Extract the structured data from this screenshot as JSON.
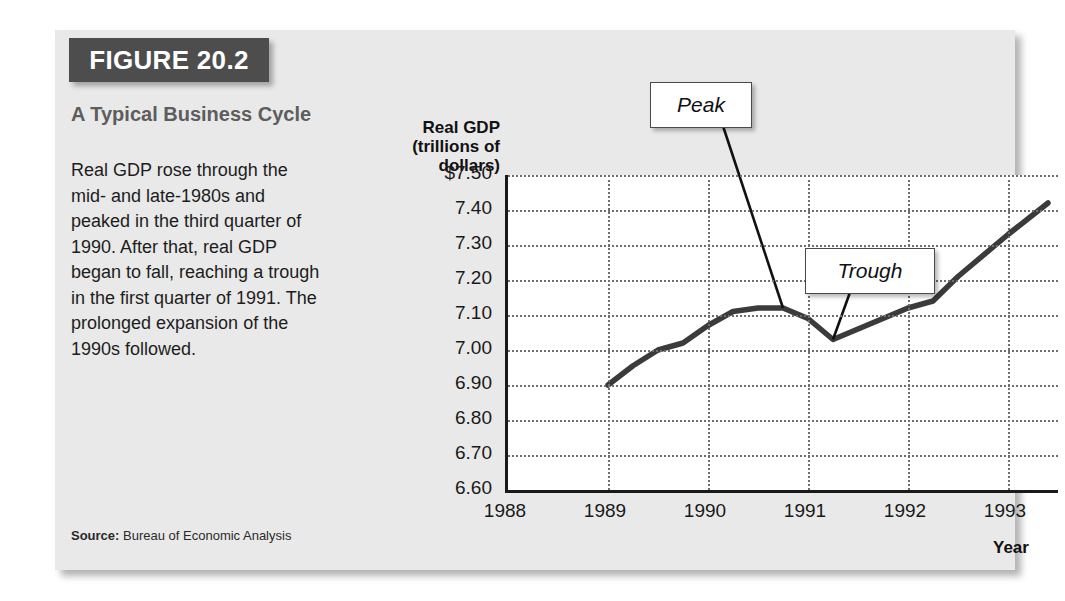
{
  "figure": {
    "header_label": "FIGURE 20.2",
    "subtitle": "A Typical Business Cycle",
    "body_text": "Real GDP rose through the mid- and late-1980s and peaked in the third quarter of 1990. After that, real GDP began to fall, reaching a trough in the first quarter of 1991. The prolonged expansion of the 1990s followed.",
    "source_label": "Source:",
    "source_value": "Bureau of Economic Analysis"
  },
  "chart_data": {
    "type": "line",
    "title": "A Typical Business Cycle",
    "ylabel": "Real GDP (trillions of dollars)",
    "xlabel": "Year",
    "ylim": [
      6.6,
      7.5
    ],
    "xlim": [
      1988,
      1993.5
    ],
    "grid": true,
    "legend": "none",
    "ytick_labels": [
      "$7.50",
      "7.40",
      "7.30",
      "7.20",
      "7.10",
      "7.00",
      "6.90",
      "6.80",
      "6.70",
      "6.60"
    ],
    "ytick_values": [
      7.5,
      7.4,
      7.3,
      7.2,
      7.1,
      7.0,
      6.9,
      6.8,
      6.7,
      6.6
    ],
    "xtick_labels": [
      "1988",
      "1989",
      "1990",
      "1991",
      "1992",
      "1993"
    ],
    "xtick_values": [
      1988,
      1989,
      1990,
      1991,
      1992,
      1993
    ],
    "series": [
      {
        "name": "Real GDP",
        "color": "#3b3b3b",
        "x": [
          1989.0,
          1989.25,
          1989.5,
          1989.75,
          1990.0,
          1990.25,
          1990.5,
          1990.75,
          1991.0,
          1991.25,
          1991.5,
          1991.75,
          1992.0,
          1992.25,
          1992.5,
          1993.0,
          1993.4
        ],
        "y": [
          6.9,
          6.955,
          7.0,
          7.02,
          7.07,
          7.11,
          7.12,
          7.12,
          7.09,
          7.03,
          7.06,
          7.09,
          7.12,
          7.14,
          7.21,
          7.33,
          7.42
        ]
      }
    ],
    "annotations": [
      {
        "label": "Peak",
        "x": 1990.75,
        "y": 7.12
      },
      {
        "label": "Trough",
        "x": 1991.25,
        "y": 7.03
      }
    ]
  }
}
